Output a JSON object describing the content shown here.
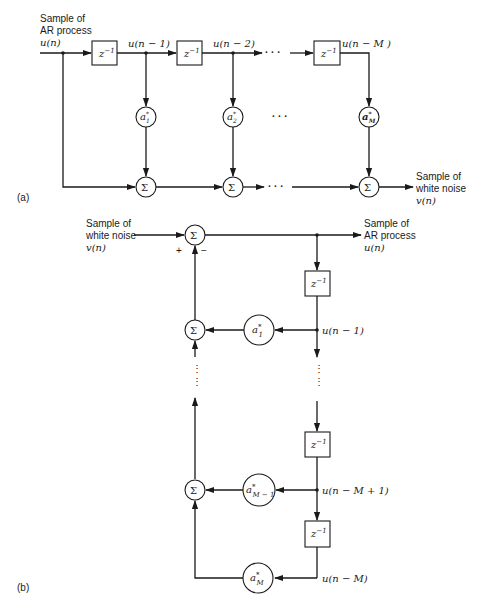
{
  "diagram": {
    "part_a": {
      "label": "(a)",
      "input": {
        "line1": "Sample of",
        "line2": "AR process",
        "line3": "u(n)"
      },
      "output": {
        "line1": "Sample of",
        "line2": "white noise",
        "line3": "v(n)"
      },
      "delays": [
        {
          "label": "z",
          "exp": "−1",
          "out": "u(n − 1)"
        },
        {
          "label": "z",
          "exp": "−1",
          "out": "u(n − 2)"
        },
        {
          "label": "z",
          "exp": "−1",
          "out": "u(n − M )"
        }
      ],
      "coefficients": [
        {
          "base": "a",
          "sup": "*",
          "sub": "1"
        },
        {
          "base": "a",
          "sup": "*",
          "sub": "2"
        },
        {
          "base": "a",
          "sup": "*",
          "sub": "M"
        }
      ],
      "summer": "Σ",
      "ellipsis": "· · ·"
    },
    "part_b": {
      "label": "(b)",
      "input": {
        "line1": "Sample of",
        "line2": "white noise",
        "line3": "v(n)"
      },
      "output": {
        "line1": "Sample of",
        "line2": "AR process",
        "line3": "u(n)"
      },
      "plus": "+",
      "minus": "−",
      "delays": [
        {
          "label": "z",
          "exp": "−1"
        },
        {
          "label": "z",
          "exp": "−1"
        },
        {
          "label": "z",
          "exp": "−1"
        }
      ],
      "taps": [
        "u(n − 1)",
        "u(n − M + 1)",
        "u(n − M)"
      ],
      "coefficients": [
        {
          "base": "a",
          "sup": "*",
          "sub": "1"
        },
        {
          "base": "a",
          "sup": "*",
          "sub": "M − 1"
        },
        {
          "base": "a",
          "sup": "*",
          "sub": "M"
        }
      ],
      "summer": "Σ",
      "vdots": "⋮"
    }
  }
}
